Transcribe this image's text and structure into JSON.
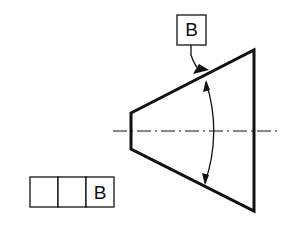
{
  "drawing": {
    "type": "GD&T angularity / datum reference on conical feature",
    "stroke_color": "#111111",
    "background": "#ffffff"
  },
  "datum_feature_symbol": {
    "letter": "B"
  },
  "feature_control_frame": {
    "cells": [
      "",
      "",
      "B"
    ]
  },
  "part": {
    "shape": "truncated cone (side view)",
    "centerline": "dash-dot axis"
  },
  "dimension": {
    "type": "angular arc with two arrowheads"
  }
}
